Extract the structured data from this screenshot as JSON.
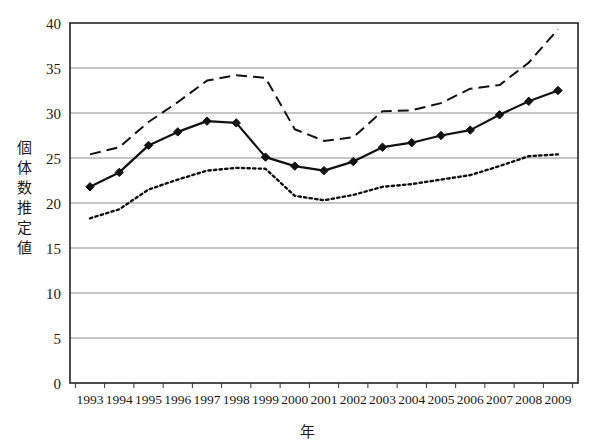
{
  "chart_data": {
    "type": "line",
    "title": "",
    "xlabel": "年",
    "ylabel": "個体数推定値",
    "x": [
      1993,
      1994,
      1995,
      1996,
      1997,
      1998,
      1999,
      2000,
      2001,
      2002,
      2003,
      2004,
      2005,
      2006,
      2007,
      2008,
      2009
    ],
    "categories": [
      "1993",
      "1994",
      "1995",
      "1996",
      "1997",
      "1998",
      "1999",
      "2000",
      "2001",
      "2002",
      "2003",
      "2004",
      "2005",
      "2006",
      "2007",
      "2008",
      "2009"
    ],
    "xlim": [
      1993,
      2009
    ],
    "ylim": [
      0,
      40
    ],
    "yticks": [
      0,
      5,
      10,
      15,
      20,
      25,
      30,
      35,
      40
    ],
    "ytick_labels": [
      "0",
      "5",
      "10",
      "15",
      "20",
      "25",
      "30",
      "35",
      "40"
    ],
    "grid": "horizontal",
    "legend": "none",
    "series": [
      {
        "name": "upper-bound",
        "style": "dashed",
        "marker": "none",
        "color": "#111111",
        "values": [
          25.4,
          26.2,
          29.0,
          31.2,
          33.6,
          34.2,
          33.9,
          28.2,
          26.9,
          27.3,
          30.2,
          30.3,
          31.1,
          32.7,
          33.1,
          35.6,
          39.3
        ]
      },
      {
        "name": "estimate",
        "style": "solid",
        "marker": "diamond",
        "color": "#111111",
        "values": [
          21.8,
          23.4,
          26.4,
          27.9,
          29.1,
          28.9,
          25.1,
          24.1,
          23.6,
          24.6,
          26.2,
          26.7,
          27.5,
          28.1,
          29.8,
          31.3,
          32.5
        ]
      },
      {
        "name": "lower-bound",
        "style": "dotted",
        "marker": "none",
        "color": "#111111",
        "values": [
          18.3,
          19.3,
          21.5,
          22.6,
          23.6,
          23.9,
          23.8,
          20.8,
          20.3,
          20.9,
          21.8,
          22.1,
          22.6,
          23.1,
          24.1,
          25.2,
          25.4
        ]
      }
    ]
  },
  "axes": {
    "y_title": "個体数推定値",
    "x_title": "年"
  }
}
